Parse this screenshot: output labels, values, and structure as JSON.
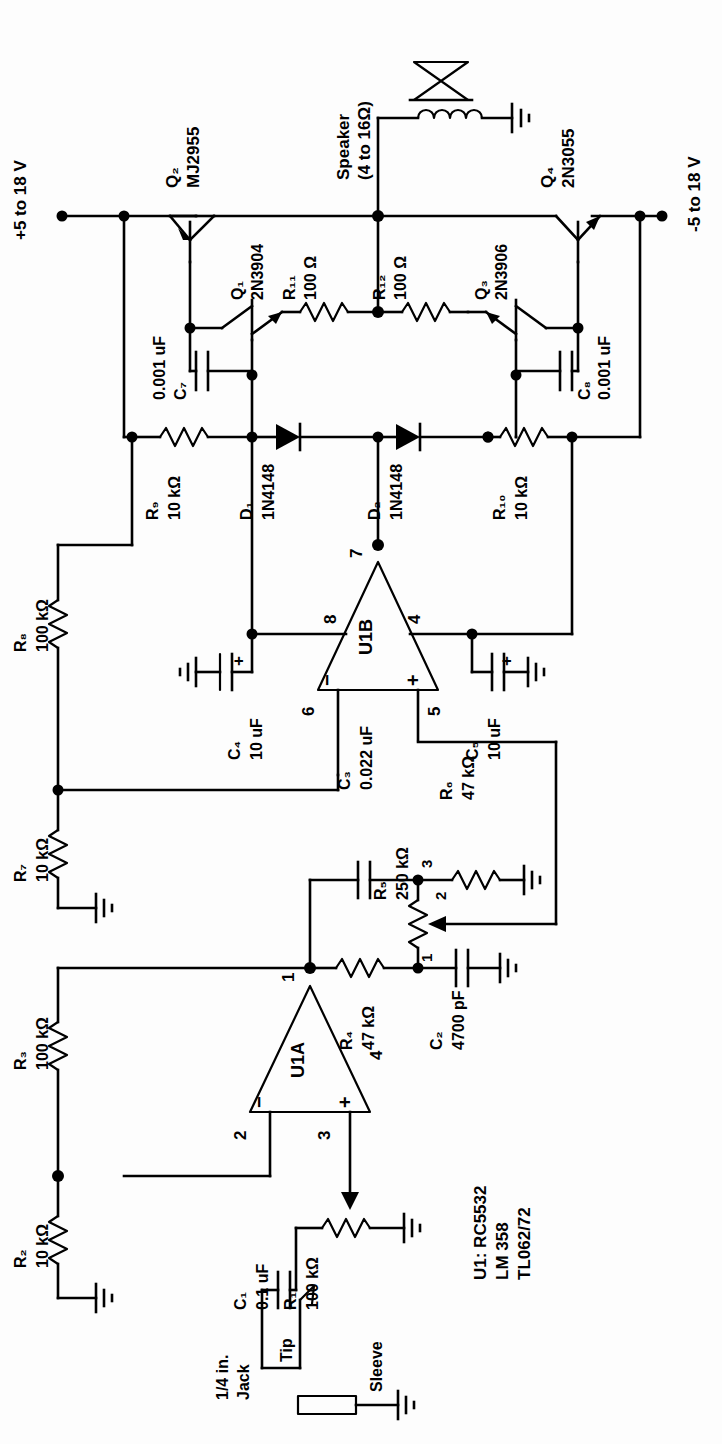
{
  "power": {
    "positive_rail": "+5 to 18 V",
    "negative_rail": "-5 to 18 V"
  },
  "output": {
    "speaker_label": "Speaker",
    "speaker_impedance": "(4 to 16Ω)"
  },
  "ic_note": {
    "line1": "U1: RC5532",
    "line2": "LM 358",
    "line3": "TL062/72"
  },
  "jack": {
    "name_line1": "1/4 in.",
    "name_line2": "Jack",
    "tip": "Tip",
    "sleeve": "Sleeve"
  },
  "opamps": [
    {
      "ref": "U1A",
      "pins": {
        "out": "1",
        "inv": "2",
        "noninv": "3",
        "vminus": "4"
      },
      "minus": "−",
      "plus": "+"
    },
    {
      "ref": "U1B",
      "pins": {
        "out": "7",
        "vplus": "8",
        "vminus": "4",
        "inv": "6",
        "noninv": "5"
      },
      "minus": "−",
      "plus": "+"
    }
  ],
  "transistors": [
    {
      "ref": "Q₁",
      "part": "2N3904"
    },
    {
      "ref": "Q₂",
      "part": "MJ2955"
    },
    {
      "ref": "Q₃",
      "part": "2N3906"
    },
    {
      "ref": "Q₄",
      "part": "2N3055"
    }
  ],
  "resistors": [
    {
      "ref": "R₁",
      "value": "100 kΩ"
    },
    {
      "ref": "R₂",
      "value": "10 kΩ"
    },
    {
      "ref": "R₃",
      "value": "100 kΩ"
    },
    {
      "ref": "R₄",
      "value": "47 kΩ"
    },
    {
      "ref": "R₅",
      "value": "250 kΩ",
      "terminals": [
        "1",
        "2",
        "3"
      ]
    },
    {
      "ref": "R₆",
      "value": "47 kΩ"
    },
    {
      "ref": "R₇",
      "value": "10 kΩ"
    },
    {
      "ref": "R₈",
      "value": "100 kΩ"
    },
    {
      "ref": "R₉",
      "value": "10 kΩ"
    },
    {
      "ref": "R₁₀",
      "value": "10 kΩ"
    },
    {
      "ref": "R₁₁",
      "value": "100 Ω"
    },
    {
      "ref": "R₁₂",
      "value": "100 Ω"
    }
  ],
  "capacitors": [
    {
      "ref": "C₁",
      "value": "0.1 uF"
    },
    {
      "ref": "C₂",
      "value": "4700 pF"
    },
    {
      "ref": "C₃",
      "value": "0.022 uF"
    },
    {
      "ref": "C₄",
      "value": "10 uF",
      "polarity": "+"
    },
    {
      "ref": "C₅",
      "value": "10 uF",
      "polarity": "+"
    },
    {
      "ref": "C₇",
      "value": "0.001 uF"
    },
    {
      "ref": "C₈",
      "value": "0.001 uF"
    }
  ],
  "diodes": [
    {
      "ref": "D₁",
      "part": "1N4148"
    },
    {
      "ref": "D₂",
      "part": "1N4148"
    }
  ],
  "colors": {
    "ink": "#000000",
    "paper": "#fdfdfd"
  }
}
